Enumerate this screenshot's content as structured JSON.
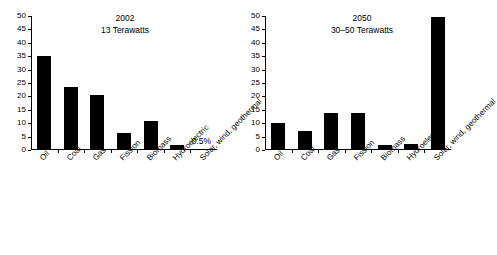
{
  "chart_data": [
    {
      "type": "bar",
      "id": "panel-2002",
      "title": "2002",
      "subtitle": "13 Terawatts",
      "xlabel": "",
      "ylabel": "",
      "ylim": [
        0,
        50
      ],
      "yticks": [
        0,
        5,
        10,
        15,
        20,
        25,
        30,
        35,
        40,
        45,
        50
      ],
      "grid": false,
      "legend": "none",
      "bar_color": "#000000",
      "categories": [
        "Oil",
        "Coal",
        "Gas",
        "Fission",
        "Biomass",
        "Hydroelectric",
        "Solar, wind, geothermal"
      ],
      "values": [
        35,
        23.5,
        20.5,
        6.5,
        10.7,
        2,
        0.5
      ],
      "annotations": [
        {
          "text": "0.5%",
          "category": "Solar, wind, geothermal",
          "value": 0.5
        }
      ]
    },
    {
      "type": "bar",
      "id": "panel-2050",
      "title": "2050",
      "subtitle": "30–50 Terawatts",
      "xlabel": "",
      "ylabel": "",
      "ylim": [
        0,
        50
      ],
      "yticks": [
        0,
        5,
        10,
        15,
        20,
        25,
        30,
        35,
        40,
        45,
        50
      ],
      "grid": false,
      "legend": "none",
      "bar_color": "#000000",
      "categories": [
        "Oil",
        "Coal",
        "Gas",
        "Fission",
        "Biomass",
        "Hydroelectric",
        "Solar, wind, geothermal"
      ],
      "values": [
        10,
        7,
        13.9,
        13.9,
        1.9,
        2.2,
        49.5
      ],
      "annotations": []
    }
  ],
  "panels": {
    "left": {
      "title": "2002",
      "subtitle": "13 Terawatts",
      "yticks": [
        "50",
        "45",
        "40",
        "35",
        "30",
        "25",
        "20",
        "15",
        "10",
        "5",
        "0"
      ],
      "categories": [
        "Oil",
        "Coal",
        "Gas",
        "Fission",
        "Biomass",
        "Hydroelectric",
        "Solar, wind, geothermal"
      ],
      "annotation": "0.5%"
    },
    "right": {
      "title": "2050",
      "subtitle": "30–50 Terawatts",
      "yticks": [
        "50",
        "45",
        "40",
        "35",
        "30",
        "25",
        "20",
        "15",
        "10",
        "5",
        "0"
      ],
      "categories": [
        "Oil",
        "Coal",
        "Gas",
        "Fission",
        "Biomass",
        "Hydroelectric",
        "Solar, wind, geothermal"
      ]
    }
  }
}
